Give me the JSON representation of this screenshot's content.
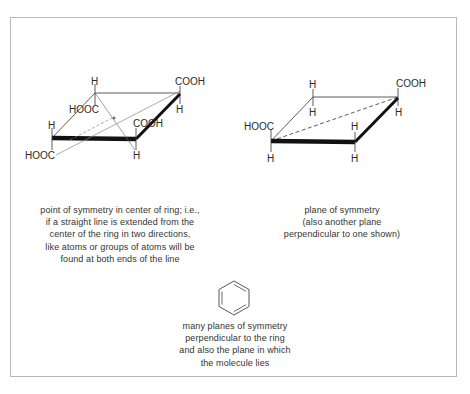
{
  "figures": {
    "left": {
      "labels": {
        "top_h": "H",
        "top_right_cooh": "COOH",
        "inner_hooc": "HOOC",
        "top_right_h": "H",
        "left_h": "H",
        "front_cooh": "COOH",
        "bottom_hooc": "HOOC",
        "front_h": "H"
      },
      "caption": [
        "point of symmetry in center of ring; i.e.,",
        "if a straight line is extended from the",
        "center of the ring in two directions,",
        "like atoms or groups of atoms will be",
        "found at both ends of the line"
      ]
    },
    "right": {
      "labels": {
        "back_h_top": "H",
        "back_h_bottom": "H",
        "right_cooh": "COOH",
        "right_h": "H",
        "left_hooc": "HOOC",
        "left_h": "H",
        "front_h_top": "H",
        "front_h_bottom": "H"
      },
      "caption": [
        "plane of symmetry",
        "(also another plane",
        "perpendicular to one shown)"
      ]
    },
    "benzene": {
      "caption": [
        "many planes of symmetry",
        "perpendicular to the ring",
        "and also the plane in which",
        "the molecule lies"
      ]
    }
  }
}
